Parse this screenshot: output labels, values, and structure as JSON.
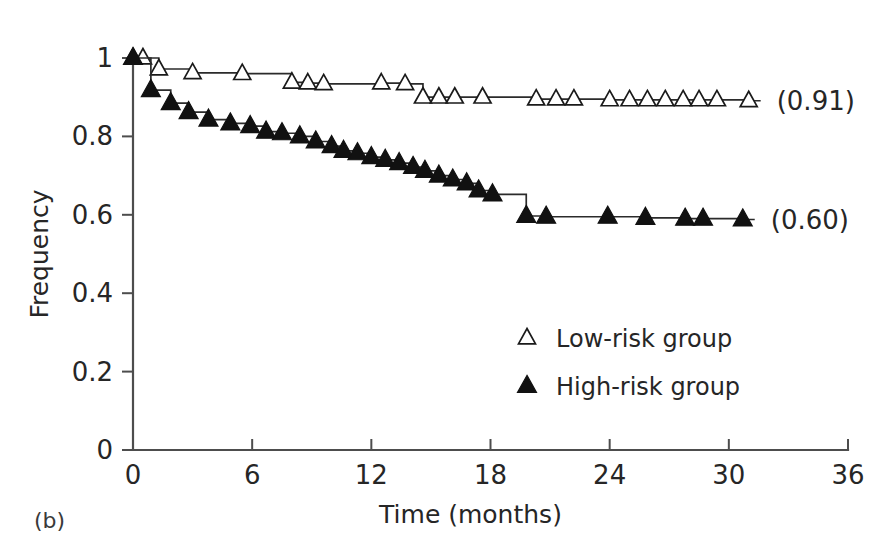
{
  "figure": {
    "panel_label": "(b)",
    "background_color": "#ffffff",
    "line_color": "#2b2b2b"
  },
  "chart_data": {
    "type": "line",
    "title": "",
    "subtitle": "",
    "xlabel": "Time (months)",
    "ylabel": "Frequency",
    "xlim": [
      0,
      36
    ],
    "ylim": [
      0,
      1
    ],
    "xticks": [
      0,
      6,
      12,
      18,
      24,
      30,
      36
    ],
    "xtick_labels": [
      "0",
      "6",
      "12",
      "18",
      "24",
      "30",
      "36"
    ],
    "yticks": [
      0,
      0.2,
      0.4,
      0.6,
      0.8,
      1
    ],
    "ytick_labels": [
      "0",
      "0.2",
      "0.4",
      "0.6",
      "0.8",
      "1"
    ],
    "grid": false,
    "legend_position": "center-right",
    "step_style": "post",
    "series": [
      {
        "name": "Low-risk group",
        "marker": "triangle-open",
        "end_label": "(0.91)",
        "final_value": 0.91,
        "x": [
          0.0,
          0.5,
          1.3,
          3.0,
          5.5,
          8.0,
          8.8,
          9.6,
          12.5,
          13.7,
          14.6,
          15.4,
          16.2,
          17.6,
          20.3,
          21.3,
          22.2,
          24.0,
          25.0,
          25.9,
          26.8,
          27.7,
          28.5,
          29.4,
          31.0
        ],
        "y": [
          1.0,
          1.0,
          0.972,
          0.962,
          0.96,
          0.938,
          0.936,
          0.934,
          0.936,
          0.934,
          0.9,
          0.9,
          0.9,
          0.9,
          0.895,
          0.895,
          0.895,
          0.893,
          0.893,
          0.893,
          0.893,
          0.893,
          0.893,
          0.893,
          0.891
        ]
      },
      {
        "name": "High-risk group",
        "marker": "triangle-filled",
        "end_label": "(0.60)",
        "final_value": 0.6,
        "x": [
          0.0,
          0.9,
          1.9,
          2.8,
          3.8,
          4.9,
          5.9,
          6.7,
          7.5,
          8.4,
          9.2,
          10.0,
          10.6,
          11.3,
          12.0,
          12.7,
          13.4,
          14.1,
          14.7,
          15.4,
          16.1,
          16.8,
          17.4,
          18.1,
          19.8,
          20.8,
          23.9,
          25.8,
          27.8,
          28.7,
          30.7
        ],
        "y": [
          1.0,
          0.918,
          0.885,
          0.862,
          0.843,
          0.833,
          0.826,
          0.812,
          0.808,
          0.8,
          0.787,
          0.775,
          0.763,
          0.757,
          0.747,
          0.74,
          0.732,
          0.722,
          0.712,
          0.7,
          0.69,
          0.68,
          0.662,
          0.652,
          0.597,
          0.595,
          0.595,
          0.592,
          0.59,
          0.59,
          0.588
        ]
      }
    ]
  },
  "legend": {
    "entries": [
      {
        "label": "Low-risk group",
        "marker": "triangle-open"
      },
      {
        "label": "High-risk group",
        "marker": "triangle-filled"
      }
    ]
  }
}
